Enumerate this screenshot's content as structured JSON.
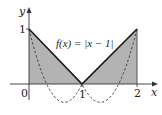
{
  "diagram": {
    "function_label": "f(x) = |x − 1|",
    "axes": {
      "x_label": "x",
      "y_label": "y",
      "x_ticks": [
        "0",
        "1",
        "2"
      ],
      "y_ticks": [
        "1"
      ]
    },
    "curves": [
      {
        "name": "f(x) = |x − 1|",
        "style": "solid",
        "points": [
          [
            0,
            1
          ],
          [
            1,
            0
          ],
          [
            2,
            1
          ]
        ]
      },
      {
        "name": "(x − 1)^2",
        "style": "dashed"
      }
    ],
    "shaded_region": {
      "from_x": 0,
      "to_x": 2,
      "under": "f(x) = |x − 1|"
    },
    "colors": {
      "fill": "#b3b3b3",
      "line": "#1a1a1a",
      "axis": "#333333"
    }
  }
}
